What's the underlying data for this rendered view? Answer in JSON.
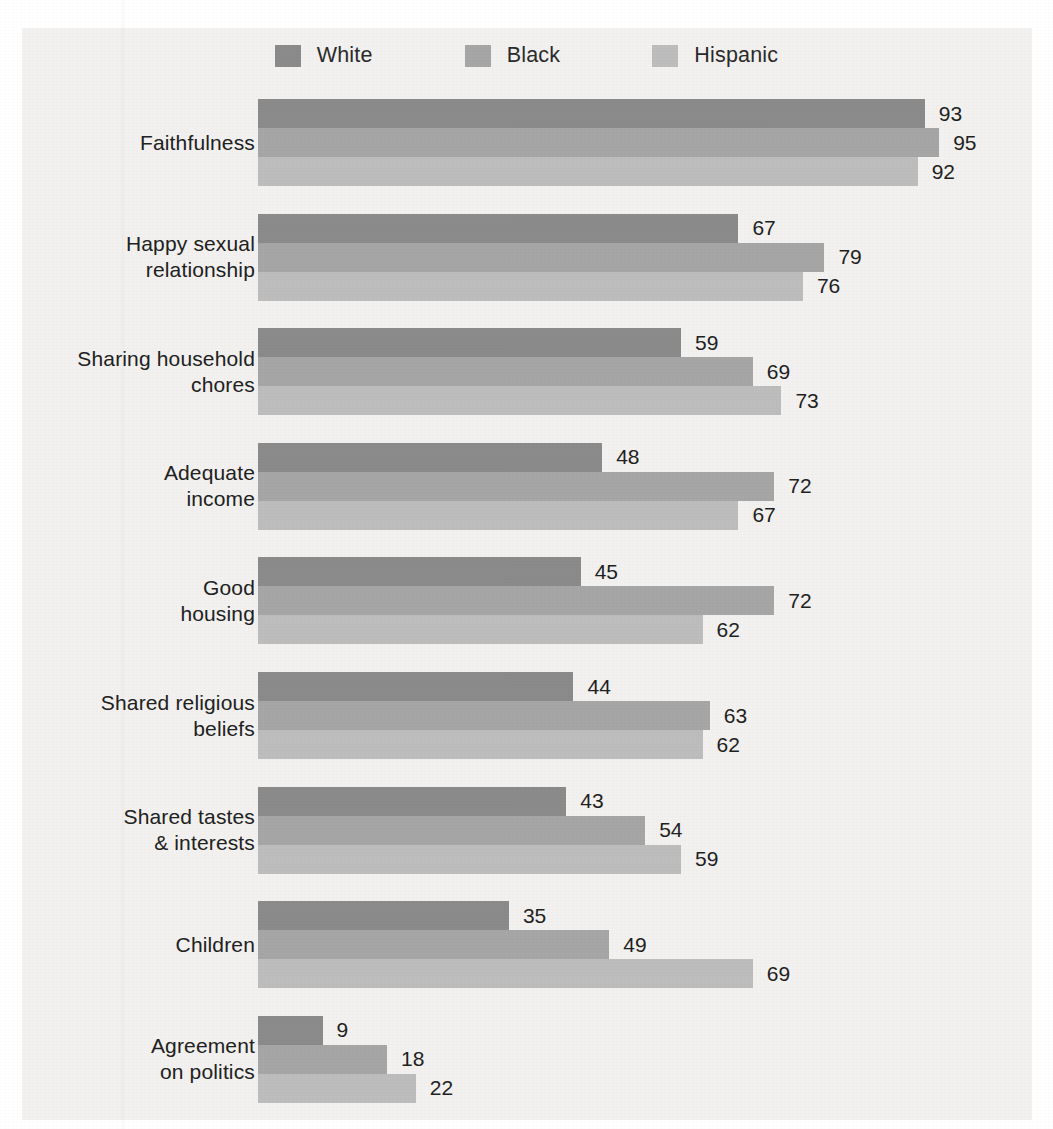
{
  "chart_data": {
    "type": "bar",
    "orientation": "horizontal",
    "grouped": true,
    "title": "",
    "subtitle": "",
    "xlabel": "",
    "ylabel": "",
    "xlim": [
      0,
      100
    ],
    "grid": false,
    "legend_position": "top-center",
    "categories": [
      "Faithfulness",
      "Happy sexual\nrelationship",
      "Sharing household\nchores",
      "Adequate\nincome",
      "Good\nhousing",
      "Shared religious\nbeliefs",
      "Shared tastes\n& interests",
      "Children",
      "Agreement\non politics"
    ],
    "series": [
      {
        "name": "White",
        "color": "#8b8b8b",
        "values": [
          93,
          67,
          59,
          48,
          45,
          44,
          43,
          35,
          9
        ]
      },
      {
        "name": "Black",
        "color": "#a6a6a6",
        "values": [
          95,
          79,
          69,
          72,
          72,
          63,
          54,
          49,
          18
        ]
      },
      {
        "name": "Hispanic",
        "color": "#bdbdbd",
        "values": [
          92,
          76,
          73,
          67,
          62,
          62,
          59,
          69,
          22
        ]
      }
    ]
  },
  "legend": {
    "items": [
      {
        "label": "White",
        "color": "#8b8b8b"
      },
      {
        "label": "Black",
        "color": "#a6a6a6"
      },
      {
        "label": "Hispanic",
        "color": "#bdbdbd"
      }
    ]
  },
  "colors": {
    "page_background": "#f2f1ef",
    "white_series": "#8b8b8b",
    "black_series": "#a6a6a6",
    "hispanic_series": "#bdbdbd",
    "text": "#212121"
  }
}
